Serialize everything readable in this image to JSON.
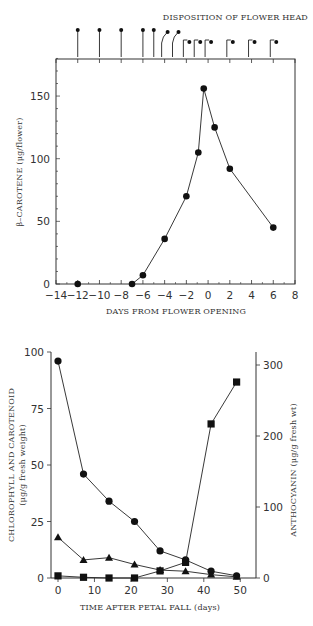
{
  "chart_data": [
    {
      "type": "line",
      "title": "",
      "annotation": "DISPOSITION  OF FLOWER HEAD",
      "xlabel": "DAYS FROM FLOWER OPENING",
      "ylabel": "β-CAROTENE (μg/flower)",
      "xlim": [
        -14,
        8
      ],
      "ylim": [
        0,
        180
      ],
      "xticks": [
        -14,
        -12,
        -10,
        -8,
        -6,
        -4,
        -2,
        0,
        2,
        4,
        6,
        8
      ],
      "yticks": [
        0,
        50,
        100,
        150
      ],
      "grid": false,
      "legend": "none",
      "series": [
        {
          "name": "β-carotene",
          "marker": "circle",
          "x": [
            -12,
            -7,
            -6,
            -4,
            -2,
            -0.9,
            -0.4,
            0.6,
            2,
            6
          ],
          "y": [
            0,
            0,
            7,
            36,
            70,
            105,
            156,
            125,
            92,
            45
          ],
          "connected_from_index": 1
        }
      ],
      "flower_head_stages": {
        "x": [
          -12,
          -10,
          -8,
          -6,
          -5,
          -4,
          -3,
          -2,
          -1,
          0,
          2,
          4,
          6
        ],
        "stage": [
          "upright",
          "upright",
          "upright",
          "upright",
          "upright",
          "tilted",
          "tilted",
          "hooked",
          "hooked",
          "hooked",
          "hooked",
          "hooked",
          "hooked"
        ]
      }
    },
    {
      "type": "line",
      "title": "",
      "xlabel": "TIME AFTER PETAL FALL (days)",
      "ylabel": "CHLOROPHYLL AND CAROTENOID (μg/g fresh weight)",
      "ylabel_right": "ANTHOCYANIN (μg/g fresh wt)",
      "xlim": [
        -2,
        55
      ],
      "ylim": [
        0,
        100
      ],
      "ylim_right": [
        0,
        325
      ],
      "xticks": [
        0,
        10,
        20,
        30,
        40,
        50
      ],
      "yticks": [
        0,
        25,
        50,
        75,
        100
      ],
      "yticks_right": [
        0,
        100,
        200,
        300
      ],
      "grid": false,
      "legend": "none",
      "series": [
        {
          "name": "Chlorophyll",
          "marker": "circle",
          "axis": "left",
          "x": [
            0,
            7,
            14,
            21,
            28,
            35,
            42,
            49
          ],
          "y": [
            96,
            46,
            34,
            25,
            12,
            8,
            3,
            1
          ]
        },
        {
          "name": "Carotenoid",
          "marker": "triangle",
          "axis": "left",
          "x": [
            0,
            7,
            14,
            21,
            28,
            35,
            42,
            49
          ],
          "y": [
            18,
            8,
            9,
            6,
            3.5,
            3,
            1.5,
            0.5
          ]
        },
        {
          "name": "Anthocyanin",
          "marker": "square",
          "axis": "right",
          "x": [
            0,
            7,
            14,
            21,
            28,
            35,
            42,
            49
          ],
          "y": [
            3,
            1,
            0,
            0,
            10,
            22,
            217,
            276
          ]
        }
      ]
    }
  ],
  "labels": {
    "top_annotation": "DISPOSITION  OF FLOWER HEAD",
    "top_xlabel": "DAYS FROM FLOWER OPENING",
    "top_ylabel": "β–CAROTENE (μg/flower)",
    "bottom_xlabel": "TIME AFTER PETAL FALL (days)",
    "bottom_ylabel_line1": "CHLOROPHYLL AND CAROTENOID",
    "bottom_ylabel_line2": "(μg/g fresh weight)",
    "bottom_ylabel_right": "ANTHOCYANIN (μg/g fresh wt)"
  },
  "colors": {
    "axis": "#333333",
    "marker": "#111111",
    "left_label": "#7a3030",
    "right_label": "#3d5a3d",
    "right_tick_100": "#8a3a6a"
  }
}
